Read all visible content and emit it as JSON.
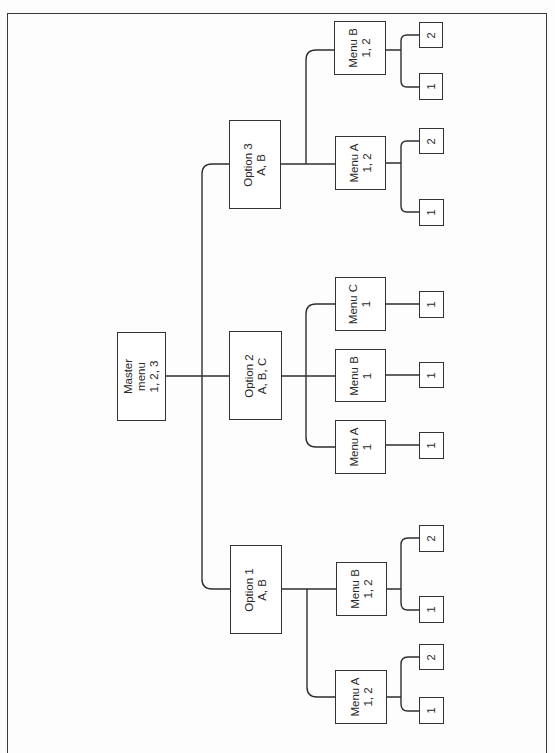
{
  "diagram": {
    "type": "tree",
    "orientation": "rotated-90-ccw",
    "root": {
      "id": "master",
      "lines": [
        "Master",
        "menu",
        "1, 2, 3"
      ],
      "box": [
        117,
        332,
        49,
        89
      ],
      "children": [
        {
          "id": "opt1",
          "lines": [
            "Option 1",
            "A, B"
          ],
          "box": [
            230,
            545,
            52,
            89
          ],
          "children": [
            {
              "id": "opt1-menuA",
              "lines": [
                "Menu A",
                "1, 2"
              ],
              "box": [
                335,
                670,
                52,
                54
              ],
              "children": [
                {
                  "id": "opt1-menuA-2",
                  "lines": [
                    "2"
                  ],
                  "box": [
                    419,
                    644,
                    25,
                    26
                  ]
                },
                {
                  "id": "opt1-menuA-1",
                  "lines": [
                    "1"
                  ],
                  "box": [
                    419,
                    697,
                    25,
                    27
                  ]
                }
              ]
            },
            {
              "id": "opt1-menuB",
              "lines": [
                "Menu B",
                "1, 2"
              ],
              "box": [
                336,
                562,
                51,
                54
              ],
              "children": [
                {
                  "id": "opt1-menuB-2",
                  "lines": [
                    "2"
                  ],
                  "box": [
                    419,
                    525,
                    25,
                    27
                  ]
                },
                {
                  "id": "opt1-menuB-1",
                  "lines": [
                    "1"
                  ],
                  "box": [
                    419,
                    596,
                    25,
                    27
                  ]
                }
              ]
            }
          ]
        },
        {
          "id": "opt2",
          "lines": [
            "Option 2",
            "A, B, C"
          ],
          "box": [
            229,
            331,
            53,
            89
          ],
          "children": [
            {
              "id": "opt2-menuA",
              "lines": [
                "Menu A",
                "1"
              ],
              "box": [
                335,
                420,
                51,
                54
              ],
              "children": [
                {
                  "id": "opt2-menuA-1",
                  "lines": [
                    "1"
                  ],
                  "box": [
                    419,
                    432,
                    25,
                    27
                  ]
                }
              ]
            },
            {
              "id": "opt2-menuB",
              "lines": [
                "Menu B",
                "1"
              ],
              "box": [
                335,
                349,
                51,
                53
              ],
              "children": [
                {
                  "id": "opt2-menuB-1",
                  "lines": [
                    "1"
                  ],
                  "box": [
                    419,
                    362,
                    25,
                    26
                  ]
                }
              ]
            },
            {
              "id": "opt2-menuC",
              "lines": [
                "Menu C",
                "1"
              ],
              "box": [
                335,
                277,
                51,
                54
              ],
              "children": [
                {
                  "id": "opt2-menuC-1",
                  "lines": [
                    "1"
                  ],
                  "box": [
                    419,
                    291,
                    25,
                    27
                  ]
                }
              ]
            }
          ]
        },
        {
          "id": "opt3",
          "lines": [
            "Option 3",
            "A, B"
          ],
          "box": [
            229,
            120,
            52,
            89
          ],
          "children": [
            {
              "id": "opt3-menuA",
              "lines": [
                "Menu A",
                "1, 2"
              ],
              "box": [
                335,
                136,
                51,
                54
              ],
              "children": [
                {
                  "id": "opt3-menuA-2",
                  "lines": [
                    "2"
                  ],
                  "box": [
                    419,
                    128,
                    25,
                    26
                  ]
                },
                {
                  "id": "opt3-menuA-1",
                  "lines": [
                    "1"
                  ],
                  "box": [
                    419,
                    199,
                    25,
                    27
                  ]
                }
              ]
            },
            {
              "id": "opt3-menuB",
              "lines": [
                "Menu B",
                "1, 2"
              ],
              "box": [
                334,
                21,
                52,
                54
              ],
              "children": [
                {
                  "id": "opt3-menuB-2",
                  "lines": [
                    "2"
                  ],
                  "box": [
                    419,
                    22,
                    24,
                    26
                  ]
                },
                {
                  "id": "opt3-menuB-1",
                  "lines": [
                    "1"
                  ],
                  "box": [
                    419,
                    73,
                    24,
                    27
                  ]
                }
              ]
            }
          ]
        }
      ]
    }
  },
  "labels": {
    "master": [
      "Master",
      "menu",
      "1, 2, 3"
    ],
    "opt1": [
      "Option 1",
      "A, B"
    ],
    "opt2": [
      "Option 2",
      "A, B, C"
    ],
    "opt3": [
      "Option 3",
      "A, B"
    ],
    "opt1_menuA": [
      "Menu A",
      "1, 2"
    ],
    "opt1_menuB": [
      "Menu B",
      "1, 2"
    ],
    "opt2_menuA": [
      "Menu A",
      "1"
    ],
    "opt2_menuB": [
      "Menu B",
      "1"
    ],
    "opt2_menuC": [
      "Menu C",
      "1"
    ],
    "opt3_menuA": [
      "Menu A",
      "1, 2"
    ],
    "opt3_menuB": [
      "Menu B",
      "1, 2"
    ],
    "leaf_1": "1",
    "leaf_2": "2"
  }
}
